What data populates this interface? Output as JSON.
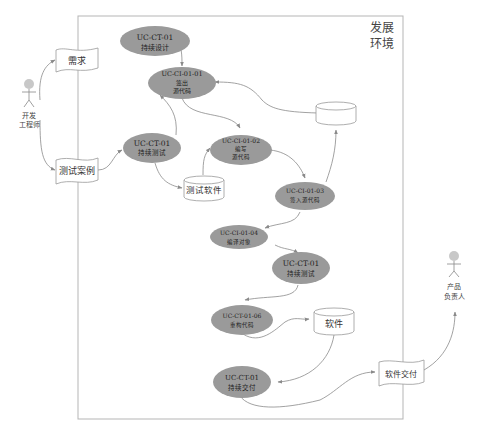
{
  "diagram": {
    "type": "continuous-delivery-flow",
    "environment": {
      "label_line1": "发展",
      "label_line2": "环境"
    },
    "actors": [
      {
        "id": "developer",
        "line1": "开发",
        "line2": "工程师"
      },
      {
        "id": "product-owner",
        "line1": "产品",
        "line2": "负责人"
      }
    ],
    "documents": [
      {
        "id": "requirements",
        "label": "需求"
      },
      {
        "id": "test-cases",
        "label": "测试案例"
      },
      {
        "id": "software-delivery",
        "label": "软件交付"
      }
    ],
    "databases": [
      {
        "id": "source-repo",
        "label": ""
      },
      {
        "id": "test-software",
        "label": "测试软件"
      },
      {
        "id": "software",
        "label": "软件"
      }
    ],
    "use_cases": [
      {
        "id": "ct01-design",
        "line1": "UC-CT-01",
        "line2": "持续设计",
        "line3": ""
      },
      {
        "id": "ci0101",
        "line1": "UC-CI-01-01",
        "line2": "签出",
        "line3": "源代码"
      },
      {
        "id": "ct01-test",
        "line1": "UC-CT-01",
        "line2": "持续测试",
        "line3": ""
      },
      {
        "id": "ci0102",
        "line1": "UC-CI-01-02",
        "line2": "编写",
        "line3": "源代码"
      },
      {
        "id": "ci0103",
        "line1": "UC-CI-01-03",
        "line2": "签入源代码",
        "line3": ""
      },
      {
        "id": "ci0104",
        "line1": "UC-CI-01-04",
        "line2": "编译对象",
        "line3": ""
      },
      {
        "id": "ct01-test2",
        "line1": "UC-CT-01",
        "line2": "持续测试",
        "line3": ""
      },
      {
        "id": "ct0106",
        "line1": "UC-CT-01-06",
        "line2": "重构代码",
        "line3": ""
      },
      {
        "id": "ct01-deliver",
        "line1": "UC-CT-01",
        "line2": "持续交付",
        "line3": ""
      }
    ],
    "colors": {
      "ellipse_fill": "#9a9a9a",
      "line": "#8a8a8a",
      "border": "#b0b0b0",
      "actor_head": "#c8c8c8"
    }
  }
}
